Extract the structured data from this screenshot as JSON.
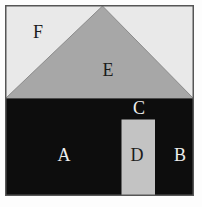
{
  "figure": {
    "labels": {
      "a": "A",
      "b": "B",
      "c": "C",
      "d": "D",
      "e": "E",
      "f": "F"
    },
    "colors": {
      "page_background": "#fdfdfd",
      "upper_region": "#e9e9e9",
      "triangle": "#a7a7a7",
      "triangle_edge": "#8b8b8b",
      "lower_region": "#0d0d0d",
      "pillar": "#c3c3c3",
      "square_border": "#565656",
      "label_dark": "#1c1c1c",
      "label_light": "#eeeeee"
    }
  }
}
